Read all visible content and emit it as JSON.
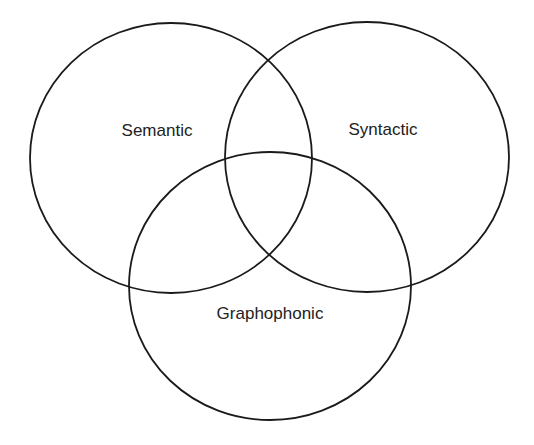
{
  "diagram": {
    "type": "venn",
    "stroke_color": "#1a1a1a",
    "circles": [
      {
        "id": "semantic",
        "label": "Semantic",
        "cx": 171,
        "cy": 158,
        "rx": 141,
        "ry": 135,
        "label_x": 157,
        "label_y": 136
      },
      {
        "id": "syntactic",
        "label": "Syntactic",
        "cx": 367,
        "cy": 157,
        "rx": 142,
        "ry": 135,
        "label_x": 383,
        "label_y": 135
      },
      {
        "id": "graphophonic",
        "label": "Graphophonic",
        "cx": 270,
        "cy": 286,
        "rx": 141,
        "ry": 134,
        "label_x": 270,
        "label_y": 319
      }
    ]
  }
}
